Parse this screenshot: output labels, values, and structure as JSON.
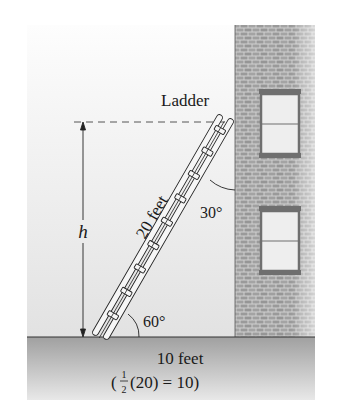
{
  "figure": {
    "labels": {
      "ladder": "Ladder",
      "ladder_length": "20 feet",
      "height": "h",
      "wall_angle": "30°",
      "ground_angle": "60°",
      "base_distance": "10 feet",
      "computation_open": "(",
      "frac_num": "1",
      "frac_den": "2",
      "computation_rest": "(20) = 10)"
    },
    "colors": {
      "sky_top": "#fbfbfb",
      "sky_bottom": "#e6e6e6",
      "brick": "#9a9a9a",
      "mortar": "#d2d2d2",
      "ground": "#a8a8a8",
      "window_frame": "#6f6f6f",
      "window_glass": "#eeeeee",
      "ink": "#1a1a1a"
    }
  }
}
